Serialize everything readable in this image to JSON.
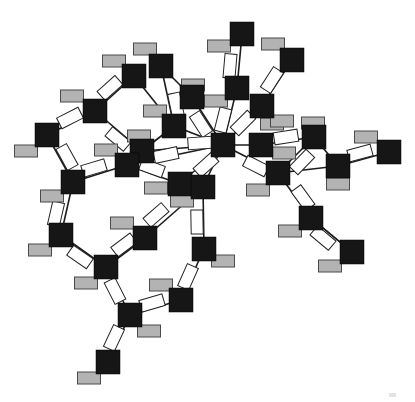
{
  "canvas": {
    "width": 415,
    "height": 402,
    "background": "#ffffff"
  },
  "palette": {
    "node_fill": "#161616",
    "node_stroke": "#000000",
    "badge_fill": "#b3b3b3",
    "badge_stroke": "#4a4a4a",
    "label_fill": "#ffffff",
    "label_stroke": "#222222",
    "edge_color": "#1c1c1c",
    "artifact_fill": "#d9d9d9"
  },
  "geometry": {
    "node_size": 24,
    "badge_w": 23,
    "badge_h": 12,
    "label_w": 24,
    "label_h": 12,
    "edge_width": 1.6
  },
  "graph": {
    "nodes": [
      {
        "id": "A",
        "x": 161,
        "y": 66
      },
      {
        "id": "B",
        "x": 134,
        "y": 76
      },
      {
        "id": "C",
        "x": 95,
        "y": 111
      },
      {
        "id": "D",
        "x": 47,
        "y": 135
      },
      {
        "id": "E",
        "x": 242,
        "y": 34
      },
      {
        "id": "F",
        "x": 292,
        "y": 60
      },
      {
        "id": "G",
        "x": 192,
        "y": 97
      },
      {
        "id": "H",
        "x": 237,
        "y": 88
      },
      {
        "id": "I",
        "x": 262,
        "y": 106
      },
      {
        "id": "J",
        "x": 174,
        "y": 126
      },
      {
        "id": "K",
        "x": 142,
        "y": 151
      },
      {
        "id": "L",
        "x": 127,
        "y": 165
      },
      {
        "id": "M",
        "x": 180,
        "y": 184
      },
      {
        "id": "N",
        "x": 203,
        "y": 187
      },
      {
        "id": "O",
        "x": 223,
        "y": 145
      },
      {
        "id": "P",
        "x": 261,
        "y": 145
      },
      {
        "id": "Q",
        "x": 314,
        "y": 137
      },
      {
        "id": "R",
        "x": 389,
        "y": 152
      },
      {
        "id": "S",
        "x": 338,
        "y": 166
      },
      {
        "id": "T",
        "x": 278,
        "y": 173
      },
      {
        "id": "U",
        "x": 61,
        "y": 235
      },
      {
        "id": "V",
        "x": 73,
        "y": 182
      },
      {
        "id": "W",
        "x": 145,
        "y": 238
      },
      {
        "id": "X",
        "x": 204,
        "y": 249
      },
      {
        "id": "Y",
        "x": 311,
        "y": 218
      },
      {
        "id": "Z",
        "x": 352,
        "y": 252
      },
      {
        "id": "AA",
        "x": 106,
        "y": 267
      },
      {
        "id": "AB",
        "x": 130,
        "y": 315
      },
      {
        "id": "AC",
        "x": 108,
        "y": 362
      },
      {
        "id": "AD",
        "x": 181,
        "y": 300
      }
    ],
    "edges": [
      {
        "from": "A",
        "to": "J"
      },
      {
        "from": "A",
        "to": "G"
      },
      {
        "from": "B",
        "to": "J"
      },
      {
        "from": "B",
        "to": "C"
      },
      {
        "from": "C",
        "to": "D"
      },
      {
        "from": "C",
        "to": "K"
      },
      {
        "from": "D",
        "to": "V"
      },
      {
        "from": "V",
        "to": "L"
      },
      {
        "from": "V",
        "to": "U"
      },
      {
        "from": "U",
        "to": "AA"
      },
      {
        "from": "AA",
        "to": "W"
      },
      {
        "from": "AA",
        "to": "AB"
      },
      {
        "from": "AB",
        "to": "AC"
      },
      {
        "from": "AB",
        "to": "AD"
      },
      {
        "from": "AD",
        "to": "X"
      },
      {
        "from": "W",
        "to": "N"
      },
      {
        "from": "N",
        "to": "X"
      },
      {
        "from": "E",
        "to": "H"
      },
      {
        "from": "H",
        "to": "O"
      },
      {
        "from": "G",
        "to": "O"
      },
      {
        "from": "J",
        "to": "K"
      },
      {
        "from": "J",
        "to": "O"
      },
      {
        "from": "K",
        "to": "O"
      },
      {
        "from": "L",
        "to": "O"
      },
      {
        "from": "L",
        "to": "M"
      },
      {
        "from": "M",
        "to": "O"
      },
      {
        "from": "N",
        "to": "O"
      },
      {
        "from": "I",
        "to": "O"
      },
      {
        "from": "F",
        "to": "I"
      },
      {
        "from": "P",
        "to": "O"
      },
      {
        "from": "P",
        "to": "Q"
      },
      {
        "from": "Q",
        "to": "S"
      },
      {
        "from": "Q",
        "to": "T"
      },
      {
        "from": "S",
        "to": "T"
      },
      {
        "from": "S",
        "to": "R"
      },
      {
        "from": "O",
        "to": "T"
      },
      {
        "from": "T",
        "to": "Y"
      },
      {
        "from": "Y",
        "to": "Z"
      },
      {
        "from": "Z",
        "to": "Y"
      }
    ],
    "badges": [
      {
        "node": "A",
        "x": 145,
        "y": 49
      },
      {
        "node": "B",
        "x": 114,
        "y": 61
      },
      {
        "node": "C",
        "x": 72,
        "y": 96
      },
      {
        "node": "D",
        "x": 26,
        "y": 151
      },
      {
        "node": "E",
        "x": 219,
        "y": 46
      },
      {
        "node": "F",
        "x": 273,
        "y": 44
      },
      {
        "node": "G",
        "x": 193,
        "y": 85
      },
      {
        "node": "H",
        "x": 216,
        "y": 101
      },
      {
        "node": "I",
        "x": 272,
        "y": 124
      },
      {
        "node": "J",
        "x": 155,
        "y": 111
      },
      {
        "node": "K",
        "x": 139,
        "y": 136
      },
      {
        "node": "L",
        "x": 106,
        "y": 150
      },
      {
        "node": "M",
        "x": 156,
        "y": 188
      },
      {
        "node": "N",
        "x": 182,
        "y": 201
      },
      {
        "node": "P",
        "x": 284,
        "y": 153
      },
      {
        "node": "P2",
        "x": 282,
        "y": 121
      },
      {
        "node": "Q",
        "x": 313,
        "y": 123
      },
      {
        "node": "R",
        "x": 366,
        "y": 137
      },
      {
        "node": "S",
        "x": 338,
        "y": 184
      },
      {
        "node": "T",
        "x": 258,
        "y": 190
      },
      {
        "node": "U",
        "x": 40,
        "y": 250
      },
      {
        "node": "V",
        "x": 52,
        "y": 196
      },
      {
        "node": "W",
        "x": 122,
        "y": 223
      },
      {
        "node": "X",
        "x": 223,
        "y": 261
      },
      {
        "node": "Y",
        "x": 290,
        "y": 231
      },
      {
        "node": "Z",
        "x": 330,
        "y": 266
      },
      {
        "node": "AA",
        "x": 86,
        "y": 283
      },
      {
        "node": "AB",
        "x": 149,
        "y": 331
      },
      {
        "node": "AC",
        "x": 89,
        "y": 378
      },
      {
        "node": "AD",
        "x": 161,
        "y": 285
      }
    ],
    "edge_labels": [
      {
        "edge": "B-C",
        "x": 110,
        "y": 88,
        "rot": -42
      },
      {
        "edge": "C-D",
        "x": 70,
        "y": 118,
        "rot": -27
      },
      {
        "edge": "C-K",
        "x": 118,
        "y": 139,
        "rot": 40
      },
      {
        "edge": "D-V",
        "x": 67,
        "y": 157,
        "rot": 61
      },
      {
        "edge": "V-L",
        "x": 94,
        "y": 168,
        "rot": -17
      },
      {
        "edge": "V-U",
        "x": 56,
        "y": 214,
        "rot": -77
      },
      {
        "edge": "U-AA",
        "x": 80,
        "y": 257,
        "rot": 35
      },
      {
        "edge": "AA-W",
        "x": 124,
        "y": 245,
        "rot": -37
      },
      {
        "edge": "E-H",
        "x": 230,
        "y": 66,
        "rot": -85
      },
      {
        "edge": "A-J",
        "x": 176,
        "y": 105,
        "rot": 78
      },
      {
        "edge": "G-O",
        "x": 201,
        "y": 124,
        "rot": 57
      },
      {
        "edge": "H-O",
        "x": 223,
        "y": 120,
        "rot": -76
      },
      {
        "edge": "I-O",
        "x": 243,
        "y": 123,
        "rot": -45
      },
      {
        "edge": "F-I",
        "x": 272,
        "y": 80,
        "rot": -57
      },
      {
        "edge": "K-O",
        "x": 200,
        "y": 143,
        "rot": -4
      },
      {
        "edge": "L-O",
        "x": 166,
        "y": 155,
        "rot": -12
      },
      {
        "edge": "L-M",
        "x": 152,
        "y": 168,
        "rot": 20
      },
      {
        "edge": "M-O",
        "x": 206,
        "y": 165,
        "rot": -42
      },
      {
        "edge": "O-T",
        "x": 256,
        "y": 166,
        "rot": 27
      },
      {
        "edge": "P-Q",
        "x": 286,
        "y": 137,
        "rot": -9
      },
      {
        "edge": "Q-T",
        "x": 302,
        "y": 162,
        "rot": -46
      },
      {
        "edge": "S-R",
        "x": 360,
        "y": 153,
        "rot": -15
      },
      {
        "edge": "T-Y",
        "x": 303,
        "y": 198,
        "rot": 54
      },
      {
        "edge": "Y-Z",
        "x": 323,
        "y": 238,
        "rot": 40
      },
      {
        "edge": "W-N",
        "x": 156,
        "y": 215,
        "rot": -41
      },
      {
        "edge": "N-X",
        "x": 197,
        "y": 222,
        "rot": 89
      },
      {
        "edge": "X-AD",
        "x": 188,
        "y": 277,
        "rot": -66
      },
      {
        "edge": "AB-AD",
        "x": 152,
        "y": 303,
        "rot": -16
      },
      {
        "edge": "AA-AB",
        "x": 115,
        "y": 291,
        "rot": 63
      },
      {
        "edge": "AB-AC",
        "x": 114,
        "y": 338,
        "rot": -65
      }
    ]
  },
  "scan_artifact": {
    "x": 389,
    "y": 393,
    "w": 7,
    "h": 4
  }
}
